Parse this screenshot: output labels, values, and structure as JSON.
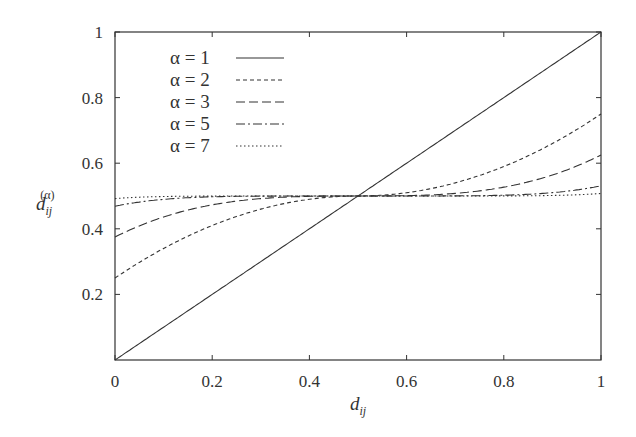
{
  "chart_data": {
    "type": "line",
    "title": "",
    "xlabel": "d_ij",
    "ylabel": "d_ij^(α)",
    "xlim": [
      0,
      1
    ],
    "ylim": [
      0,
      1
    ],
    "grid": false,
    "legend_position": "upper-left (inside)",
    "x_ticks": [
      "0",
      "0.2",
      "0.4",
      "0.6",
      "0.8",
      "1"
    ],
    "y_ticks": [
      "0.2",
      "0.4",
      "0.6",
      "0.8",
      "1"
    ],
    "x": [
      0,
      0.1,
      0.2,
      0.3,
      0.4,
      0.5,
      0.6,
      0.7,
      0.8,
      0.9,
      1.0
    ],
    "series": [
      {
        "name": "α = 1",
        "style": "solid",
        "values": [
          0.0,
          0.1,
          0.2,
          0.3,
          0.4,
          0.5,
          0.6,
          0.7,
          0.8,
          0.9,
          1.0
        ]
      },
      {
        "name": "α = 2",
        "style": "dashed-short",
        "values": [
          0.25,
          0.34,
          0.41,
          0.46,
          0.49,
          0.5,
          0.51,
          0.54,
          0.59,
          0.66,
          0.75
        ]
      },
      {
        "name": "α = 3",
        "style": "dashed-long",
        "values": [
          0.375,
          0.436,
          0.473,
          0.492,
          0.499,
          0.5,
          0.501,
          0.508,
          0.527,
          0.564,
          0.625
        ]
      },
      {
        "name": "α = 5",
        "style": "dash-dot",
        "values": [
          0.469,
          0.49,
          0.498,
          0.5,
          0.5,
          0.5,
          0.5,
          0.5,
          0.502,
          0.51,
          0.531
        ]
      },
      {
        "name": "α = 7",
        "style": "dotted",
        "values": [
          0.492,
          0.498,
          0.5,
          0.5,
          0.5,
          0.5,
          0.5,
          0.5,
          0.5,
          0.502,
          0.508
        ]
      }
    ]
  },
  "legend": [
    {
      "label": "α = 1",
      "dash": ""
    },
    {
      "label": "α = 2",
      "dash": "4,3"
    },
    {
      "label": "α = 3",
      "dash": "9,4"
    },
    {
      "label": "α = 5",
      "dash": "9,3,2,3"
    },
    {
      "label": "α = 7",
      "dash": "1.5,2.5"
    }
  ],
  "axes": {
    "x_label_main": "d",
    "x_label_sub": "ij",
    "y_label_main": "d",
    "y_label_sub": "ij",
    "y_label_sup": "(α)"
  }
}
